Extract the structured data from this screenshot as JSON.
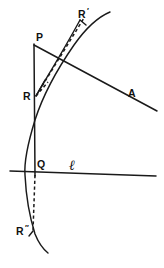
{
  "figure": {
    "background_color": "#ffffff",
    "ink_color": "#1a1a1a",
    "width": 164,
    "height": 268,
    "points": [
      {
        "id": "R-prime",
        "label": "R",
        "prime": "′",
        "x": 82,
        "y": 14
      },
      {
        "id": "P",
        "label": "P",
        "prime": "",
        "x": 39,
        "y": 38
      },
      {
        "id": "R",
        "label": "R",
        "prime": "",
        "x": 26,
        "y": 97
      },
      {
        "id": "Q",
        "label": "Q",
        "prime": "",
        "x": 40,
        "y": 165
      },
      {
        "id": "R-double-prime",
        "label": "R",
        "prime": "″",
        "x": 20,
        "y": 232
      }
    ],
    "line_labels": [
      {
        "id": "A",
        "label": "A",
        "x": 130,
        "y": 94
      },
      {
        "id": "ell",
        "label": "ℓ",
        "x": 72,
        "y": 169
      }
    ],
    "elements": {
      "arc": "curve",
      "vertical_line": "P to Q segment",
      "transversal_line": "line through P toward A",
      "horizontal_line": "line ℓ",
      "chord_dashed": "R to R prime",
      "drop_dashed": "Q to R double prime",
      "wedge_marks": "angle marks at R"
    }
  }
}
